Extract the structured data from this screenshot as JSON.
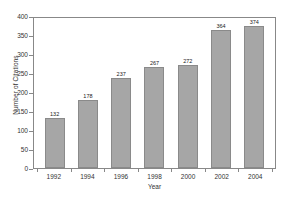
{
  "chart_data": {
    "type": "bar",
    "title": "",
    "xlabel": "Year",
    "ylabel": "Number of Citations",
    "categories": [
      "1992",
      "1994",
      "1996",
      "1998",
      "2000",
      "2002",
      "2004"
    ],
    "values": [
      132,
      178,
      237,
      267,
      272,
      364,
      374
    ],
    "data_labels": [
      "132",
      "178",
      "237",
      "267",
      "272",
      "364",
      "374"
    ],
    "ylim": [
      0,
      400
    ],
    "ytick_labels": [
      "0",
      "50",
      "100",
      "150",
      "200",
      "250",
      "300",
      "350",
      "400"
    ],
    "ytick_values": [
      0,
      50,
      100,
      150,
      200,
      250,
      300,
      350,
      400
    ],
    "grid": false,
    "legend": false,
    "legend_position": "none",
    "bar_color": "#a6a6a6",
    "bar_border_color": "#8a8a8a",
    "frame_color": "#888888",
    "text_color": "#333333",
    "background": "#ffffff"
  }
}
